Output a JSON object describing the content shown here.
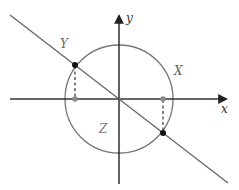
{
  "diagram": {
    "axes": {
      "x_label": "x",
      "y_label": "y",
      "origin": [
        119,
        99
      ],
      "x_axis": {
        "from": [
          10,
          99
        ],
        "to": [
          228,
          99
        ]
      },
      "y_axis": {
        "from": [
          119,
          184
        ],
        "to": [
          119,
          14
        ]
      }
    },
    "circle": {
      "cx": 119,
      "cy": 99,
      "r": 54
    },
    "line": {
      "from": [
        10,
        15
      ],
      "to": [
        228,
        183
      ]
    },
    "points": {
      "intersection_upper": [
        75,
        65
      ],
      "intersection_lower": [
        163,
        133
      ],
      "projection_left": [
        75,
        99
      ],
      "projection_right": [
        163,
        99
      ]
    },
    "region_labels": [
      {
        "text": "Y",
        "pos": [
          64,
          47
        ]
      },
      {
        "text": "X",
        "pos": [
          176,
          75
        ]
      },
      {
        "text": "Z",
        "pos": [
          101,
          132
        ]
      }
    ],
    "colors": {
      "axis": "#222222",
      "circle": "#777777",
      "line": "#666666",
      "dot_black": "#111111",
      "dot_gray": "#888888",
      "dashed": "#333333",
      "label": "#444444",
      "region_label": "#666666"
    }
  }
}
